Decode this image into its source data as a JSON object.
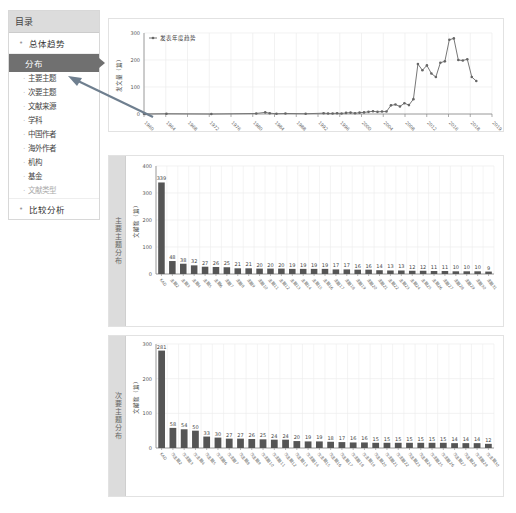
{
  "sidebar": {
    "title": "目录",
    "groups": [
      {
        "label": "总体趋势",
        "bullet": "•"
      },
      {
        "label": "比较分析",
        "bullet": "•"
      }
    ],
    "active": "分布",
    "sub_items": [
      "主要主题",
      "次要主题",
      "文献来源",
      "学科",
      "中国作者",
      "海外作者",
      "机构",
      "基金",
      "文献类型"
    ]
  },
  "panels": {
    "trend_side_label": "",
    "primary_side_label": "主要主题分布",
    "secondary_side_label": "次要主题分布"
  },
  "chart_data": [
    {
      "type": "line",
      "title": "",
      "legend": [
        "发表年度趋势"
      ],
      "ylabel": "发文量（篇）",
      "xlabel": "",
      "ylim": [
        0,
        300
      ],
      "yticks": [
        0,
        100,
        200,
        300
      ],
      "grid": true,
      "xtick_labels": [
        "1960",
        "1964",
        "1968",
        "1972",
        "1976",
        "1980",
        "1984",
        "1988",
        "1992",
        "1996",
        "2000",
        "2004",
        "2008",
        "2012",
        "2016",
        "2018",
        "2019"
      ],
      "series": [
        {
          "name": "发表年度趋势",
          "points": [
            [
              0,
              1
            ],
            [
              0.05,
              0
            ],
            [
              1,
              1
            ],
            [
              3,
              0
            ],
            [
              5,
              2
            ],
            [
              5.4,
              6
            ],
            [
              5.6,
              3
            ],
            [
              5.9,
              1
            ],
            [
              6.3,
              2
            ],
            [
              7.2,
              1
            ],
            [
              8,
              3
            ],
            [
              8.2,
              2
            ],
            [
              8.4,
              2
            ],
            [
              8.6,
              3
            ],
            [
              8.8,
              2
            ],
            [
              9,
              4
            ],
            [
              9.2,
              5
            ],
            [
              9.4,
              3
            ],
            [
              9.6,
              5
            ],
            [
              9.8,
              6
            ],
            [
              10,
              8
            ],
            [
              10.2,
              10
            ],
            [
              10.4,
              8
            ],
            [
              10.6,
              9
            ],
            [
              10.8,
              9
            ],
            [
              11,
              32
            ],
            [
              11.2,
              35
            ],
            [
              11.4,
              28
            ],
            [
              11.6,
              40
            ],
            [
              11.8,
              33
            ],
            [
              12,
              55
            ],
            [
              12.2,
              185
            ],
            [
              12.4,
              162
            ],
            [
              12.6,
              180
            ],
            [
              12.8,
              150
            ],
            [
              13,
              137
            ],
            [
              13.2,
              190
            ],
            [
              13.4,
              195
            ],
            [
              13.6,
              275
            ],
            [
              13.8,
              280
            ],
            [
              14,
              200
            ],
            [
              14.2,
              198
            ],
            [
              14.4,
              203
            ],
            [
              14.6,
              137
            ],
            [
              14.8,
              122
            ]
          ]
        }
      ]
    },
    {
      "type": "bar",
      "title": "主要主题分布",
      "ylabel": "文献数（篇）",
      "xlabel": "",
      "ylim": [
        0,
        400
      ],
      "yticks": [
        0,
        100,
        200,
        300,
        400
      ],
      "grid": true,
      "categories": [
        "KAD",
        "主题2",
        "主题3",
        "主题4",
        "主题5",
        "主题6",
        "主题7",
        "主题8",
        "主题9",
        "主题10",
        "主题11",
        "主题12",
        "主题13",
        "主题14",
        "主题15",
        "主题16",
        "主题17",
        "主题18",
        "主题19",
        "主题20",
        "主题21",
        "主题22",
        "主题23",
        "主题24",
        "主题25",
        "主题26",
        "主题27",
        "主题28",
        "主题29",
        "主题30",
        "主题31"
      ],
      "values": [
        339,
        48,
        38,
        32,
        27,
        26,
        25,
        21,
        21,
        20,
        20,
        20,
        19,
        19,
        19,
        19,
        17,
        17,
        16,
        16,
        14,
        13,
        13,
        12,
        12,
        11,
        11,
        10,
        10,
        10,
        9
      ]
    },
    {
      "type": "bar",
      "title": "次要主题分布",
      "ylabel": "文献数（篇）",
      "xlabel": "",
      "ylim": [
        0,
        300
      ],
      "yticks": [
        0,
        100,
        200,
        300
      ],
      "grid": true,
      "categories": [
        "KAD",
        "次主题2",
        "次主题3",
        "次主题4",
        "次主题5",
        "次主题6",
        "次主题7",
        "次主题8",
        "次主题9",
        "次主题10",
        "次主题11",
        "次主题12",
        "次主题13",
        "次主题14",
        "次主题15",
        "次主题16",
        "次主题17",
        "次主题18",
        "次主题19",
        "次主题20",
        "次主题21",
        "次主题22",
        "次主题23",
        "次主题24",
        "次主题25",
        "次主题26",
        "次主题27",
        "次主题28",
        "次主题29",
        "次主题30"
      ],
      "values": [
        281,
        58,
        54,
        50,
        33,
        30,
        27,
        27,
        26,
        25,
        24,
        24,
        20,
        19,
        19,
        18,
        17,
        16,
        16,
        15,
        15,
        15,
        15,
        15,
        15,
        15,
        14,
        14,
        14,
        12
      ]
    }
  ],
  "colors": {
    "bar": "#555555",
    "line": "#777777",
    "grid": "#ececec",
    "sidebar_active": "#707070",
    "arrow": "#6f7f8f"
  }
}
